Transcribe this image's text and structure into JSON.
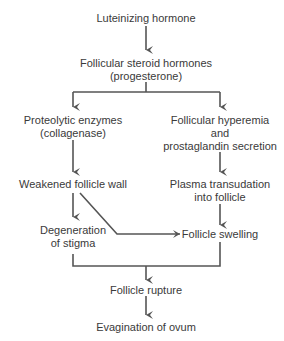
{
  "diagram": {
    "type": "flowchart",
    "line_color": "#555555",
    "nodes": {
      "lh": [
        "Luteinizing hormone"
      ],
      "steroid": [
        "Follicular steroid hormones",
        "(progesterone)"
      ],
      "proteolytic": [
        "Proteolytic enzymes",
        "(collagenase)"
      ],
      "hyperemia": [
        "Follicular hyperemia",
        "and",
        "prostaglandin secretion"
      ],
      "weakened": [
        "Weakened follicle wall"
      ],
      "plasma": [
        "Plasma transudation",
        "into follicle"
      ],
      "degeneration": [
        "Degeneration",
        "of stigma"
      ],
      "swelling": [
        "Follicle swelling"
      ],
      "rupture": [
        "Follicle rupture"
      ],
      "evagination": [
        "Evagination of ovum"
      ]
    },
    "edges": [
      [
        "lh",
        "steroid"
      ],
      [
        "steroid",
        "proteolytic"
      ],
      [
        "steroid",
        "hyperemia"
      ],
      [
        "proteolytic",
        "weakened"
      ],
      [
        "hyperemia",
        "plasma"
      ],
      [
        "weakened",
        "degeneration"
      ],
      [
        "weakened",
        "swelling"
      ],
      [
        "plasma",
        "swelling"
      ],
      [
        "degeneration",
        "rupture"
      ],
      [
        "swelling",
        "rupture"
      ],
      [
        "rupture",
        "evagination"
      ]
    ]
  }
}
